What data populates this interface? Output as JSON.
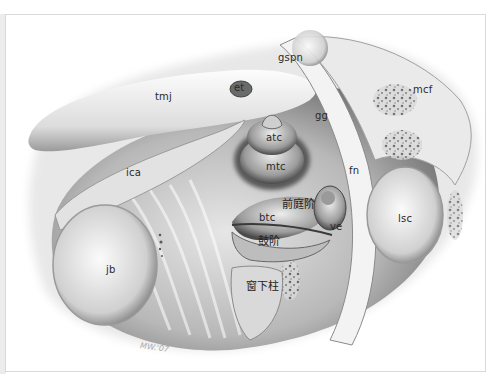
{
  "figure": {
    "type": "anatomical-illustration",
    "signature": "MW.'07",
    "labels": [
      {
        "id": "tmj",
        "text": "tmj",
        "x": 155,
        "y": 98
      },
      {
        "id": "et",
        "text": "et",
        "x": 237,
        "y": 86
      },
      {
        "id": "gspn",
        "text": "gspn",
        "x": 278,
        "y": 55
      },
      {
        "id": "gg",
        "text": "gg",
        "x": 315,
        "y": 112
      },
      {
        "id": "mcf",
        "text": "mcf",
        "x": 413,
        "y": 86
      },
      {
        "id": "atc",
        "text": "atc",
        "x": 265,
        "y": 133
      },
      {
        "id": "mtc",
        "text": "mtc",
        "x": 266,
        "y": 162
      },
      {
        "id": "ica",
        "text": "ica",
        "x": 124,
        "y": 169
      },
      {
        "id": "fn",
        "text": "fn",
        "x": 348,
        "y": 167
      },
      {
        "id": "lsc",
        "text": "lsc",
        "x": 398,
        "y": 215
      },
      {
        "id": "scala-vestibuli",
        "text": "前庭阶",
        "x": 285,
        "y": 199
      },
      {
        "id": "btc",
        "text": "btc",
        "x": 259,
        "y": 214
      },
      {
        "id": "ve",
        "text": "ve",
        "x": 329,
        "y": 222
      },
      {
        "id": "scala-tympani",
        "text": "鼓阶",
        "x": 259,
        "y": 236
      },
      {
        "id": "subiculum",
        "text": "窗下柱",
        "x": 248,
        "y": 282
      },
      {
        "id": "jb",
        "text": "jb",
        "x": 106,
        "y": 265
      }
    ]
  },
  "colors": {
    "background": "#ffffff",
    "frame_border": "#d9d9d9",
    "bone_light": "#f2f2f2",
    "bone_mid": "#c8c8c8",
    "shadow_dark": "#5a5a5a",
    "label_text": "#2a2a2a"
  }
}
